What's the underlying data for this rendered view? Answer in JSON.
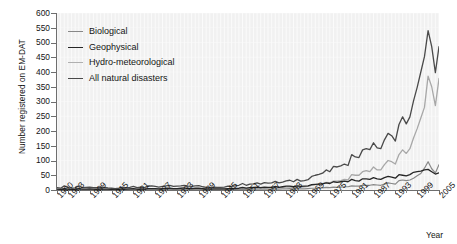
{
  "chart_data": {
    "type": "line",
    "title": "",
    "xlabel": "Year",
    "ylabel": "Number registered on EM-DAT",
    "xlim": [
      1900,
      2005
    ],
    "ylim": [
      0,
      600
    ],
    "ytick_step": 50,
    "grid": true,
    "legend_position": "upper-left",
    "ytick_labels": [
      "600",
      "550",
      "500",
      "450",
      "400",
      "350",
      "300",
      "250",
      "200",
      "150",
      "100",
      "50",
      "0"
    ],
    "xtick_labels": [
      "1900",
      "1903",
      "1909",
      "1915",
      "1921",
      "1927",
      "1933",
      "1939",
      "1945",
      "1951",
      "1957",
      "1963",
      "1969",
      "1975",
      "1981",
      "1987",
      "1993",
      "1999",
      "2005"
    ],
    "x": [
      1900,
      1901,
      1902,
      1903,
      1904,
      1905,
      1906,
      1907,
      1908,
      1909,
      1910,
      1911,
      1912,
      1913,
      1914,
      1915,
      1916,
      1917,
      1918,
      1919,
      1920,
      1921,
      1922,
      1923,
      1924,
      1925,
      1926,
      1927,
      1928,
      1929,
      1930,
      1931,
      1932,
      1933,
      1934,
      1935,
      1936,
      1937,
      1938,
      1939,
      1940,
      1941,
      1942,
      1943,
      1944,
      1945,
      1946,
      1947,
      1948,
      1949,
      1950,
      1951,
      1952,
      1953,
      1954,
      1955,
      1956,
      1957,
      1958,
      1959,
      1960,
      1961,
      1962,
      1963,
      1964,
      1965,
      1966,
      1967,
      1968,
      1969,
      1970,
      1971,
      1972,
      1973,
      1974,
      1975,
      1976,
      1977,
      1978,
      1979,
      1980,
      1981,
      1982,
      1983,
      1984,
      1985,
      1986,
      1987,
      1988,
      1989,
      1990,
      1991,
      1992,
      1993,
      1994,
      1995,
      1996,
      1997,
      1998,
      1999,
      2000,
      2001,
      2002,
      2003,
      2004,
      2005
    ],
    "series": [
      {
        "name": "All natural disasters",
        "color": "#4a4a4a",
        "width": 1.3,
        "values": [
          8,
          6,
          14,
          8,
          6,
          7,
          14,
          8,
          9,
          10,
          8,
          8,
          10,
          9,
          7,
          6,
          5,
          6,
          10,
          7,
          9,
          12,
          8,
          10,
          8,
          13,
          14,
          12,
          10,
          12,
          14,
          16,
          12,
          13,
          14,
          16,
          13,
          12,
          14,
          15,
          11,
          9,
          8,
          10,
          9,
          9,
          10,
          13,
          12,
          14,
          16,
          22,
          16,
          20,
          21,
          24,
          20,
          25,
          23,
          24,
          29,
          24,
          27,
          31,
          33,
          28,
          36,
          30,
          32,
          35,
          46,
          50,
          53,
          57,
          68,
          62,
          80,
          78,
          82,
          88,
          83,
          120,
          112,
          110,
          136,
          140,
          137,
          160,
          143,
          140,
          170,
          192,
          184,
          166,
          222,
          248,
          224,
          248,
          302,
          348,
          400,
          452,
          540,
          486,
          398,
          486
        ]
      },
      {
        "name": "Hydro-meteorological",
        "color": "#a8a8a8",
        "width": 1.3,
        "values": [
          2,
          2,
          3,
          2,
          2,
          2,
          3,
          2,
          3,
          3,
          2,
          2,
          3,
          3,
          2,
          2,
          2,
          2,
          3,
          2,
          3,
          3,
          2,
          3,
          3,
          4,
          4,
          3,
          3,
          4,
          4,
          5,
          4,
          4,
          4,
          5,
          4,
          4,
          4,
          5,
          3,
          3,
          3,
          3,
          3,
          3,
          3,
          4,
          4,
          4,
          5,
          6,
          5,
          6,
          6,
          7,
          6,
          8,
          7,
          8,
          9,
          8,
          9,
          10,
          11,
          9,
          12,
          10,
          11,
          12,
          16,
          18,
          20,
          22,
          26,
          24,
          30,
          30,
          32,
          36,
          34,
          52,
          50,
          50,
          62,
          66,
          62,
          78,
          68,
          68,
          86,
          100,
          96,
          88,
          120,
          136,
          124,
          140,
          176,
          208,
          244,
          280,
          386,
          350,
          286,
          378
        ]
      },
      {
        "name": "Biological",
        "color": "#888888",
        "width": 1.2,
        "values": [
          1,
          1,
          2,
          1,
          1,
          1,
          2,
          1,
          1,
          1,
          1,
          1,
          1,
          1,
          1,
          1,
          1,
          1,
          2,
          1,
          1,
          2,
          1,
          1,
          1,
          2,
          2,
          2,
          1,
          2,
          2,
          2,
          1,
          2,
          2,
          2,
          2,
          1,
          2,
          2,
          1,
          1,
          1,
          1,
          1,
          1,
          1,
          2,
          1,
          2,
          2,
          3,
          2,
          3,
          3,
          3,
          3,
          4,
          3,
          3,
          4,
          3,
          4,
          4,
          5,
          4,
          5,
          4,
          4,
          5,
          6,
          6,
          6,
          7,
          9,
          8,
          10,
          9,
          10,
          11,
          11,
          14,
          13,
          13,
          16,
          16,
          16,
          18,
          17,
          16,
          20,
          24,
          22,
          20,
          32,
          34,
          32,
          34,
          40,
          48,
          56,
          74,
          96,
          72,
          58,
          86
        ]
      },
      {
        "name": "Geophysical",
        "color": "#262626",
        "width": 1.3,
        "values": [
          3,
          2,
          5,
          3,
          2,
          3,
          5,
          3,
          3,
          4,
          3,
          3,
          4,
          3,
          3,
          2,
          2,
          2,
          4,
          3,
          4,
          5,
          3,
          4,
          3,
          5,
          5,
          5,
          4,
          5,
          6,
          6,
          5,
          5,
          6,
          7,
          5,
          5,
          6,
          6,
          5,
          4,
          3,
          4,
          4,
          4,
          4,
          5,
          5,
          5,
          6,
          9,
          6,
          8,
          9,
          10,
          8,
          10,
          9,
          9,
          12,
          9,
          11,
          13,
          13,
          11,
          14,
          12,
          13,
          14,
          18,
          19,
          20,
          21,
          24,
          22,
          28,
          26,
          28,
          30,
          28,
          36,
          32,
          30,
          38,
          38,
          36,
          42,
          38,
          36,
          42,
          46,
          44,
          40,
          52,
          50,
          48,
          52,
          60,
          62,
          64,
          68,
          70,
          62,
          54,
          58
        ]
      }
    ]
  },
  "legend": {
    "items": [
      {
        "label": "Biological",
        "color": "#888888"
      },
      {
        "label": "Geophysical",
        "color": "#262626"
      },
      {
        "label": "Hydro-meteorological",
        "color": "#b0b0b0"
      },
      {
        "label": "All natural disasters",
        "color": "#4a4a4a"
      }
    ]
  },
  "axes": {
    "y_title": "Number registered on EM-DAT",
    "x_title": "Year"
  }
}
